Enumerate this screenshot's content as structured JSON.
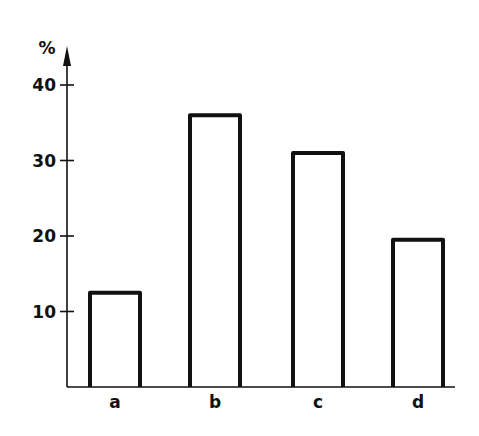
{
  "chart_data": {
    "type": "bar",
    "title": "",
    "xlabel": "",
    "ylabel": "%",
    "categories": [
      "a",
      "b",
      "c",
      "d"
    ],
    "values": [
      12.5,
      36,
      31,
      19.5
    ],
    "ylim": [
      0,
      45
    ],
    "yticks": [
      10,
      20,
      30,
      40
    ],
    "ytick_labels": [
      "10",
      "20",
      "30",
      "40"
    ],
    "grid": false,
    "legend": null,
    "bar_style": "outline"
  },
  "colors": {
    "background": "#ffffff",
    "ink": "#111111"
  }
}
